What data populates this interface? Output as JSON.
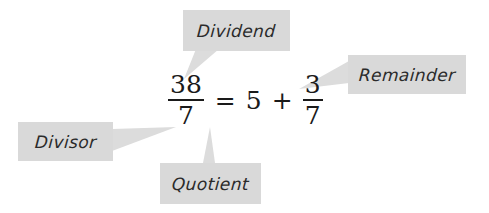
{
  "figure": {
    "background_color": "#ffffff"
  },
  "equation": {
    "left": {
      "numerator": "38",
      "denominator": "7"
    },
    "equals": "=",
    "whole": "5",
    "plus": "+",
    "right": {
      "numerator": "3",
      "denominator": "7"
    },
    "plain_text": "38/7 = 5 + 3/7"
  },
  "callouts": [
    {
      "id": "dividend",
      "label": "Dividend",
      "points_to": "38",
      "box_color": "#d9d9d9",
      "text_color": "#2b2b2b"
    },
    {
      "id": "remainder",
      "label": "Remainder",
      "points_to": "3",
      "box_color": "#d9d9d9",
      "text_color": "#2b2b2b"
    },
    {
      "id": "divisor",
      "label": "Divisor",
      "points_to": "7",
      "box_color": "#d9d9d9",
      "text_color": "#2b2b2b"
    },
    {
      "id": "quotient",
      "label": "Quotient",
      "points_to": "5",
      "box_color": "#d9d9d9",
      "text_color": "#2b2b2b"
    }
  ]
}
